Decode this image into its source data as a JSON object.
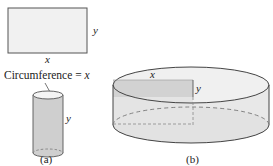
{
  "figure_a": {
    "rectangle": {
      "width_label": "x",
      "height_label": "y"
    },
    "cylinder": {
      "height_label": "y",
      "circumference_label": "Circumference = x"
    },
    "caption": "(a)"
  },
  "figure_b": {
    "cylinder": {
      "radius_label": "x",
      "height_label": "y"
    },
    "caption": "(b)"
  },
  "colors": {
    "stroke": "#444444",
    "rect_fill": "#f1f1f1",
    "small_cyl_body": "#cfcfcf",
    "small_cyl_top": "#f4f4f4",
    "big_cyl_body": "#e8e8e8",
    "big_cyl_top": "#f0f0f0",
    "cross_section": "#d2d2d2",
    "dash": "#777777"
  }
}
